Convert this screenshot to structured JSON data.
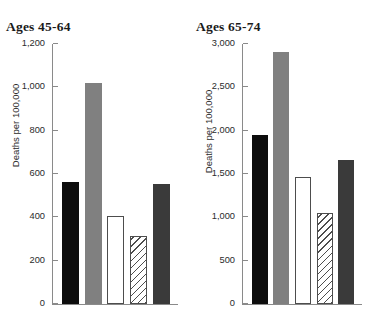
{
  "chart_data": [
    {
      "type": "bar",
      "title": "Ages 45-64",
      "xlabel": "",
      "ylabel": "Deaths per 100,000",
      "ylim": [
        0,
        1200
      ],
      "yticks": [
        0,
        200,
        400,
        600,
        800,
        1000,
        1200
      ],
      "ytick_labels": [
        "0",
        "200",
        "400",
        "600",
        "800",
        "1,000",
        "1,200"
      ],
      "grid": false,
      "legend": "none",
      "categories": [
        "bar-1",
        "bar-2",
        "bar-3",
        "bar-4",
        "bar-5"
      ],
      "values": [
        565,
        1020,
        405,
        315,
        555
      ],
      "fills": [
        "black",
        "gray",
        "white",
        "hatch",
        "darkgray"
      ]
    },
    {
      "type": "bar",
      "title": "Ages 65-74",
      "xlabel": "",
      "ylabel": "Deaths per 100,000",
      "ylim": [
        0,
        3000
      ],
      "yticks": [
        0,
        500,
        1000,
        1500,
        2000,
        2500,
        3000
      ],
      "ytick_labels": [
        "0",
        "500",
        "1,000",
        "1,500",
        "2,000",
        "2,500",
        "3,000"
      ],
      "grid": false,
      "legend": "none",
      "categories": [
        "bar-1",
        "bar-2",
        "bar-3",
        "bar-4",
        "bar-5"
      ],
      "values": [
        1950,
        2910,
        1465,
        1050,
        1660
      ],
      "fills": [
        "black",
        "gray",
        "white",
        "hatch",
        "darkgray"
      ]
    }
  ],
  "colors": {
    "black": "#0d0d0d",
    "gray": "#808080",
    "white": "#ffffff",
    "hatch_line": "#4d4d4d",
    "darkgray": "#3a3a3a",
    "axis": "#8a8a8a",
    "text": "#2b2b2b"
  }
}
